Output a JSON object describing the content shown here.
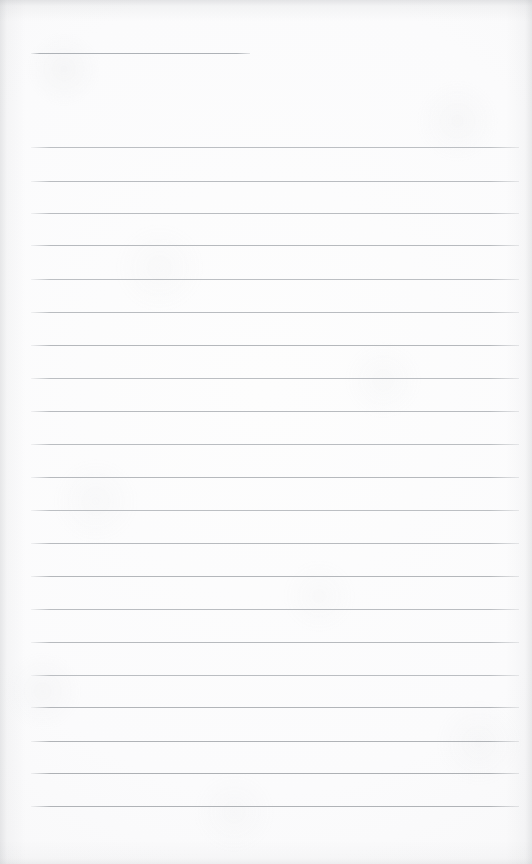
{
  "document": {
    "kind": "scanned-ruled-notebook-page",
    "title": "",
    "page_width": 532,
    "page_height": 864,
    "background_color": "#fbfbfc",
    "paper_tone": "off-white",
    "has_handwriting": false,
    "content_text": "",
    "status_note": ""
  },
  "ruling": {
    "line_color": "#b9bcc0",
    "line_thickness_px": 1,
    "left_margin_px": 31,
    "right_edge_px": 519,
    "line_spacing_px": 33,
    "header_rule": {
      "label": "header-rule",
      "y": 53,
      "x_start": 31,
      "x_end": 250,
      "color": "#aeb2b7"
    },
    "body_rules": [
      {
        "y": 147,
        "x_start": 31,
        "x_end": 519,
        "color": "#bcbfc3"
      },
      {
        "y": 181,
        "x_start": 31,
        "x_end": 519,
        "color": "#b9bcc0"
      },
      {
        "y": 213,
        "x_start": 31,
        "x_end": 519,
        "color": "#babdc1"
      },
      {
        "y": 245,
        "x_start": 31,
        "x_end": 519,
        "color": "#b7babe"
      },
      {
        "y": 279,
        "x_start": 31,
        "x_end": 519,
        "color": "#bcbfc3"
      },
      {
        "y": 312,
        "x_start": 31,
        "x_end": 519,
        "color": "#b9bcc0"
      },
      {
        "y": 345,
        "x_start": 31,
        "x_end": 519,
        "color": "#b5b8bc"
      },
      {
        "y": 378,
        "x_start": 31,
        "x_end": 519,
        "color": "#bbbec2"
      },
      {
        "y": 411,
        "x_start": 31,
        "x_end": 519,
        "color": "#b8bbbf"
      },
      {
        "y": 444,
        "x_start": 31,
        "x_end": 519,
        "color": "#babdc1"
      },
      {
        "y": 477,
        "x_start": 31,
        "x_end": 519,
        "color": "#b6b9bd"
      },
      {
        "y": 510,
        "x_start": 31,
        "x_end": 519,
        "color": "#bcbfc3"
      },
      {
        "y": 543,
        "x_start": 31,
        "x_end": 519,
        "color": "#b8bbbf"
      },
      {
        "y": 576,
        "x_start": 31,
        "x_end": 519,
        "color": "#b4b7bb"
      },
      {
        "y": 609,
        "x_start": 31,
        "x_end": 519,
        "color": "#babdc1"
      },
      {
        "y": 642,
        "x_start": 31,
        "x_end": 519,
        "color": "#b7babe"
      },
      {
        "y": 675,
        "x_start": 31,
        "x_end": 519,
        "color": "#bbbec2"
      },
      {
        "y": 707,
        "x_start": 31,
        "x_end": 519,
        "color": "#b2b5b9"
      },
      {
        "y": 741,
        "x_start": 31,
        "x_end": 519,
        "color": "#b0b3b7"
      },
      {
        "y": 773,
        "x_start": 31,
        "x_end": 519,
        "color": "#aeb1b5"
      },
      {
        "y": 806,
        "x_start": 31,
        "x_end": 519,
        "color": "#b0b3b7"
      }
    ]
  },
  "regions": {
    "header_area": {
      "label": "header-area",
      "x": 31,
      "y": 20,
      "width": 488,
      "height": 110
    },
    "body_area": {
      "label": "body-area",
      "x": 31,
      "y": 130,
      "width": 488,
      "height": 690
    },
    "footer_area": {
      "label": "footer-margin",
      "x": 31,
      "y": 812,
      "width": 488,
      "height": 46
    }
  }
}
